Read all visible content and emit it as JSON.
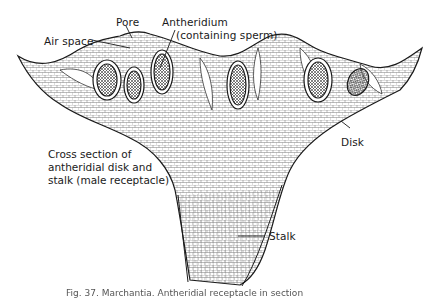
{
  "figure": {
    "labels": {
      "pore": "Pore",
      "air_space": "Air space",
      "antheridium": "Antheridium",
      "antheridium_note": "(containing sperm)",
      "disk": "Disk",
      "stalk": "Stalk"
    },
    "description": {
      "line1": "Cross section of",
      "line2": "antheridial disk and",
      "line3": "stalk (male receptacle)"
    },
    "caption": "Fig. 37. Marchantia. Antheridial receptacle in section"
  },
  "colors": {
    "ink": "#1a1a1a",
    "background": "#ffffff",
    "shading": "#6b6b6b"
  }
}
